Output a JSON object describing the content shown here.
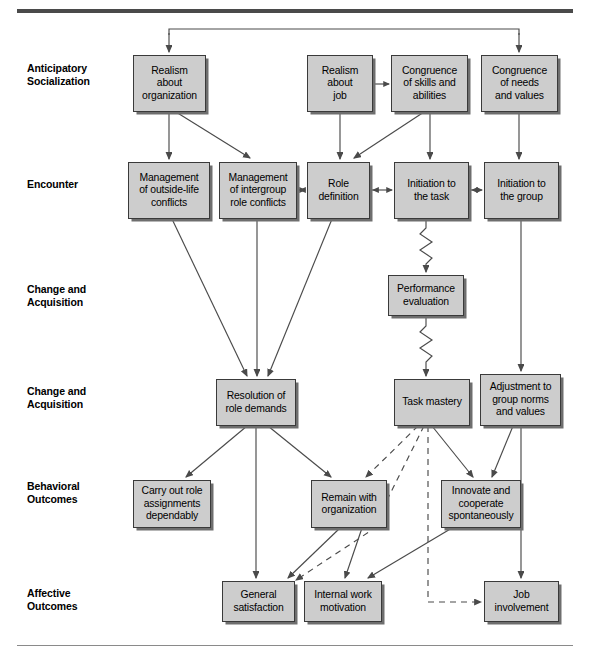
{
  "figure": {
    "background_color": "#ffffff",
    "box_fill_color": "#cdcdcd",
    "box_border_color": "#3a3a3a",
    "line_color": "#4a4a4a"
  },
  "stage_labels": [
    {
      "id": "anticipatory-socialization",
      "text": "Anticipatory\nSocialization",
      "x": 27,
      "y": 62
    },
    {
      "id": "encounter",
      "text": "Encounter",
      "x": 27,
      "y": 178
    },
    {
      "id": "change-and-acquisition-1",
      "text": "Change and\nAcquisition",
      "x": 27,
      "y": 283
    },
    {
      "id": "change-and-acquisition-2",
      "text": "Change and\nAcquisition",
      "x": 27,
      "y": 385
    },
    {
      "id": "behavioral-outcomes",
      "text": "Behavioral\nOutcomes",
      "x": 27,
      "y": 480
    },
    {
      "id": "affective-outcomes",
      "text": "Affective\nOutcomes",
      "x": 27,
      "y": 587
    }
  ],
  "nodes": [
    {
      "id": "realism-about-organization",
      "text": "Realism\nabout\norganization",
      "x": 133,
      "y": 55,
      "w": 73,
      "h": 57
    },
    {
      "id": "realism-about-job",
      "text": "Realism\nabout\njob",
      "x": 307,
      "y": 55,
      "w": 66,
      "h": 57
    },
    {
      "id": "congruence-of-skills-and-abilities",
      "text": "Congruence\nof skills and\nabilities",
      "x": 391,
      "y": 55,
      "w": 77,
      "h": 57
    },
    {
      "id": "congruence-of-needs-and-values",
      "text": "Congruence\nof needs\nand values",
      "x": 481,
      "y": 55,
      "w": 77,
      "h": 57
    },
    {
      "id": "management-of-outside-life-conflicts",
      "text": "Management\nof outside-life\nconflicts",
      "x": 128,
      "y": 162,
      "w": 82,
      "h": 57
    },
    {
      "id": "management-of-intergroup-role-conflicts",
      "text": "Management\nof intergroup\nrole conflicts",
      "x": 219,
      "y": 162,
      "w": 78,
      "h": 57
    },
    {
      "id": "role-definition",
      "text": "Role\ndefinition",
      "x": 307,
      "y": 162,
      "w": 63,
      "h": 57
    },
    {
      "id": "initiation-to-the-task",
      "text": "Initiation to\nthe task",
      "x": 394,
      "y": 162,
      "w": 75,
      "h": 57
    },
    {
      "id": "initiation-to-the-group",
      "text": "Initiation to\nthe group",
      "x": 484,
      "y": 162,
      "w": 75,
      "h": 57
    },
    {
      "id": "performance-evaluation",
      "text": "Performance\nevaluation",
      "x": 388,
      "y": 275,
      "w": 76,
      "h": 41
    },
    {
      "id": "resolution-of-role-demands",
      "text": "Resolution of\nrole demands",
      "x": 216,
      "y": 379,
      "w": 80,
      "h": 47
    },
    {
      "id": "task-mastery",
      "text": "Task mastery",
      "x": 394,
      "y": 379,
      "w": 76,
      "h": 47
    },
    {
      "id": "adjustment-to-group-norms-and-values",
      "text": "Adjustment to\ngroup norms\nand values",
      "x": 480,
      "y": 374,
      "w": 81,
      "h": 52
    },
    {
      "id": "carry-out-role-assignments-dependably",
      "text": "Carry out role\nassignments\ndependably",
      "x": 133,
      "y": 480,
      "w": 78,
      "h": 48
    },
    {
      "id": "remain-with-organization",
      "text": "Remain with\norganization",
      "x": 311,
      "y": 480,
      "w": 76,
      "h": 48
    },
    {
      "id": "innovate-and-cooperate-spontaneously",
      "text": "Innovate and\ncooperate\nspontaneously",
      "x": 441,
      "y": 480,
      "w": 80,
      "h": 48
    },
    {
      "id": "general-satisfaction",
      "text": "General\nsatisfaction",
      "x": 222,
      "y": 581,
      "w": 73,
      "h": 41
    },
    {
      "id": "internal-work-motivation",
      "text": "Internal work\nmotivation",
      "x": 304,
      "y": 581,
      "w": 78,
      "h": 41
    },
    {
      "id": "job-involvement",
      "text": "Job\ninvolvement",
      "x": 484,
      "y": 581,
      "w": 75,
      "h": 41
    }
  ],
  "connectors": {
    "solid_arrows": [
      {
        "from": "top-bracket-left",
        "to": "realism-about-organization"
      },
      {
        "from": "top-bracket-right",
        "to": "congruence-of-needs-and-values"
      },
      {
        "from": "realism-about-organization",
        "to": "management-of-outside-life-conflicts"
      },
      {
        "from": "realism-about-organization",
        "to": "management-of-intergroup-role-conflicts"
      },
      {
        "from": "realism-about-job",
        "to": "role-definition"
      },
      {
        "from": "congruence-of-skills-and-abilities",
        "to": "initiation-to-the-task"
      },
      {
        "from": "congruence-of-skills-and-abilities",
        "to": "role-definition"
      },
      {
        "from": "congruence-of-needs-and-values",
        "to": "initiation-to-the-group"
      },
      {
        "from": "management-of-outside-life-conflicts",
        "to": "resolution-of-role-demands"
      },
      {
        "from": "management-of-intergroup-role-conflicts",
        "to": "resolution-of-role-demands"
      },
      {
        "from": "role-definition",
        "to": "resolution-of-role-demands"
      },
      {
        "from": "initiation-to-the-group",
        "to": "adjustment-to-group-norms-and-values"
      },
      {
        "from": "resolution-of-role-demands",
        "to": "carry-out-role-assignments-dependably"
      },
      {
        "from": "resolution-of-role-demands",
        "to": "remain-with-organization"
      },
      {
        "from": "resolution-of-role-demands",
        "to": "general-satisfaction"
      },
      {
        "from": "task-mastery",
        "to": "innovate-and-cooperate-spontaneously"
      },
      {
        "from": "adjustment-to-group-norms-and-values",
        "to": "innovate-and-cooperate-spontaneously"
      },
      {
        "from": "adjustment-to-group-norms-and-values",
        "to": "job-involvement"
      },
      {
        "from": "remain-with-organization",
        "to": "general-satisfaction"
      },
      {
        "from": "remain-with-organization",
        "to": "internal-work-motivation"
      },
      {
        "from": "innovate-and-cooperate-spontaneously",
        "to": "internal-work-motivation"
      }
    ],
    "double_headed_arrows": [
      {
        "between": [
          "management-of-intergroup-role-conflicts",
          "role-definition"
        ]
      },
      {
        "between": [
          "role-definition",
          "initiation-to-the-task"
        ]
      },
      {
        "between": [
          "initiation-to-the-task",
          "initiation-to-the-group"
        ]
      },
      {
        "between": [
          "realism-about-job",
          "congruence-of-skills-and-abilities"
        ]
      }
    ],
    "zigzag_arrows": [
      {
        "from": "initiation-to-the-task",
        "to": "performance-evaluation"
      },
      {
        "from": "performance-evaluation",
        "to": "task-mastery"
      }
    ],
    "dashed_arrows": [
      {
        "from": "task-mastery",
        "to": "remain-with-organization"
      },
      {
        "from": "task-mastery",
        "to": "general-satisfaction"
      },
      {
        "from": "task-mastery",
        "to": "job-involvement"
      }
    ]
  }
}
